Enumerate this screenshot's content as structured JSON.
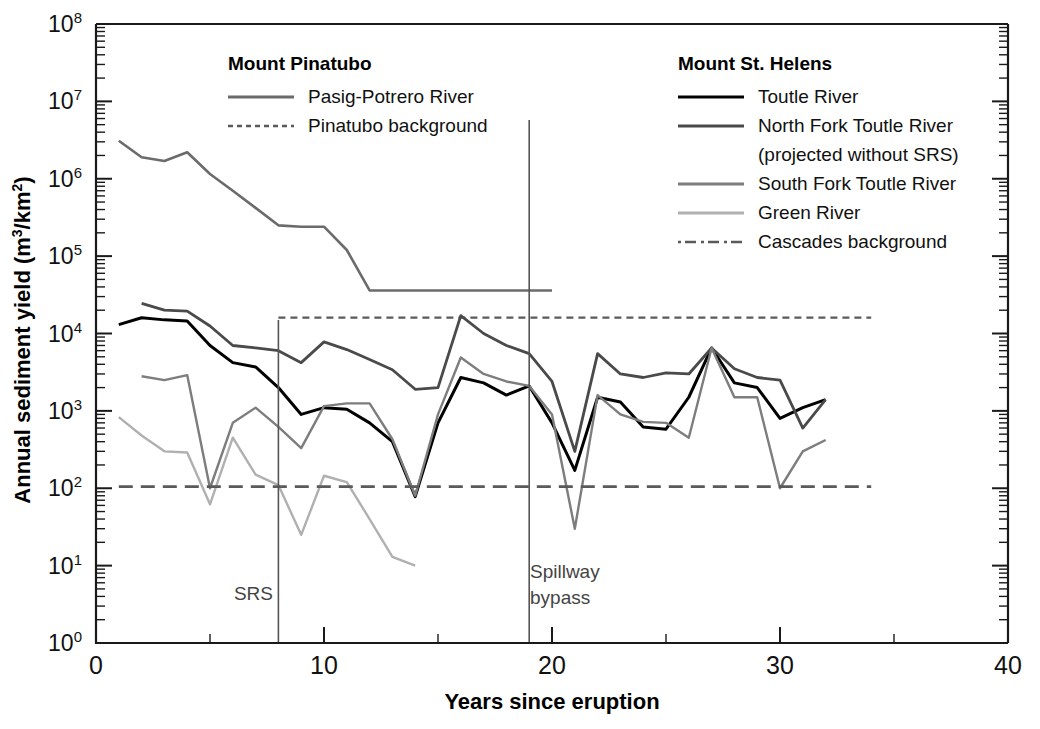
{
  "chart_data": {
    "type": "line",
    "title": "",
    "xlabel": "Years since eruption",
    "ylabel": "Annual sediment yield (m3/km2)",
    "ylabel_parts": {
      "text": "Annual sediment yield (m",
      "sup1": "3",
      "mid": "/km",
      "sup2": "2",
      "tail": ")"
    },
    "xlim": [
      0,
      40
    ],
    "ylim": [
      1,
      100000000
    ],
    "yscale": "log",
    "xscale": "linear",
    "grid": false,
    "xticks": [
      0,
      10,
      20,
      30,
      40
    ],
    "xticklabels": [
      "0",
      "10",
      "20",
      "30",
      "40"
    ],
    "xminorticks": [
      5,
      15,
      25,
      35
    ],
    "yticks": [
      1,
      10,
      100,
      1000,
      10000,
      100000,
      1000000,
      10000000,
      100000000
    ],
    "yticklabels": [
      "10⁰",
      "10¹",
      "10²",
      "10³",
      "10⁴",
      "10⁵",
      "10⁶",
      "10⁷",
      "10⁸"
    ],
    "yticklabel_exponents": [
      "0",
      "1",
      "2",
      "3",
      "4",
      "5",
      "6",
      "7",
      "8"
    ],
    "legend_position": "top-center",
    "series": [
      {
        "name": "Pasig-Potrero River",
        "group": "Mount Pinatubo",
        "color": "#6b6b6b",
        "width": 2.6,
        "dash": "none",
        "x": [
          1,
          2,
          3,
          4,
          5,
          6,
          7,
          8,
          9,
          10,
          11,
          12,
          13,
          14,
          15,
          16,
          17,
          18,
          19,
          20
        ],
        "y": [
          3100000,
          1900000,
          1700000,
          2200000,
          1150000,
          700000,
          420000,
          250000,
          240000,
          240000,
          120000,
          36000,
          36000,
          36000,
          36000,
          36000,
          36000,
          36000,
          36000,
          36000
        ]
      },
      {
        "name": "Pinatubo background",
        "group": "Mount Pinatubo",
        "color": "#5a5a5a",
        "width": 2.2,
        "dash": "7,5",
        "x": [
          8,
          34
        ],
        "y": [
          16000,
          16000
        ],
        "constant": 16000
      },
      {
        "name": "Toutle River",
        "group": "Mount St. Helens",
        "color": "#000000",
        "width": 3.0,
        "dash": "none",
        "x": [
          1,
          2,
          3,
          4,
          5,
          6,
          7,
          8,
          9,
          10,
          11,
          12,
          13,
          14,
          15,
          16,
          17,
          18,
          19,
          20,
          21,
          22,
          23,
          24,
          25,
          26,
          27,
          28,
          29,
          30,
          31,
          32
        ],
        "y": [
          13000,
          16000,
          15000,
          14500,
          7000,
          4200,
          3700,
          2000,
          900,
          1100,
          1050,
          700,
          400,
          78,
          700,
          2700,
          2300,
          1600,
          2100,
          700,
          170,
          1500,
          1300,
          620,
          580,
          1500,
          6500,
          2300,
          2000,
          800,
          1100,
          1400
        ]
      },
      {
        "name": "North Fork Toutle River (projected without SRS)",
        "group": "Mount St. Helens",
        "color": "#4a4a4a",
        "width": 2.8,
        "dash": "none",
        "x": [
          2,
          3,
          4,
          5,
          6,
          7,
          8,
          9,
          10,
          11,
          12,
          13,
          14,
          15,
          16,
          17,
          18,
          19,
          20,
          21,
          22,
          23,
          24,
          25,
          26,
          27,
          28,
          29,
          30,
          31,
          32
        ],
        "y": [
          24500,
          20000,
          19500,
          12500,
          7000,
          6500,
          6000,
          4200,
          7800,
          6200,
          4600,
          3400,
          1900,
          2000,
          17000,
          10000,
          7000,
          5500,
          2400,
          300,
          5500,
          3000,
          2700,
          3100,
          3000,
          6500,
          3500,
          2700,
          2500,
          600,
          1400
        ]
      },
      {
        "name": "South Fork Toutle River",
        "group": "Mount St. Helens",
        "color": "#7d7d7d",
        "width": 2.4,
        "dash": "none",
        "x": [
          2,
          3,
          4,
          5,
          6,
          7,
          8,
          9,
          10,
          11,
          12,
          13,
          14,
          15,
          16,
          17,
          18,
          19,
          20,
          21,
          22,
          23,
          24,
          25,
          26,
          27,
          28,
          29,
          30,
          31,
          32
        ],
        "y": [
          2800,
          2500,
          2900,
          100,
          700,
          1100,
          620,
          330,
          1150,
          1250,
          1250,
          430,
          80,
          900,
          4900,
          3000,
          2400,
          2100,
          900,
          30,
          1600,
          900,
          720,
          700,
          450,
          6500,
          1500,
          1500,
          100,
          300,
          420
        ]
      },
      {
        "name": "Green River",
        "group": "Mount St. Helens",
        "color": "#b0b0b0",
        "width": 2.4,
        "dash": "none",
        "x": [
          1,
          2,
          3,
          4,
          5,
          6,
          7,
          8,
          9,
          10,
          11,
          12,
          13,
          14
        ],
        "y": [
          830,
          480,
          300,
          290,
          62,
          450,
          150,
          110,
          25,
          145,
          120,
          40,
          13,
          10
        ]
      },
      {
        "name": "Cascades background",
        "group": "Mount St. Helens",
        "color": "#5a5a5a",
        "width": 2.6,
        "dash": "14,8",
        "x": [
          1,
          34
        ],
        "y": [
          105,
          105
        ],
        "constant": 105
      }
    ],
    "annotations": [
      {
        "label": "SRS",
        "x": 8,
        "type": "vertical-line",
        "text_anchor": "end",
        "text_x": 7.6,
        "text_y": 320
      },
      {
        "label_line1": "Spillway",
        "label_line2": "bypass",
        "x": 19,
        "type": "vertical-line",
        "text_anchor": "start",
        "text_x": 19.4,
        "text_y": 120
      }
    ]
  },
  "legend": {
    "columns": [
      {
        "heading": "Mount Pinatubo",
        "entries": [
          {
            "label": "Pasig-Potrero River",
            "color": "#6b6b6b",
            "dash": "none"
          },
          {
            "label": "Pinatubo background",
            "color": "#5a5a5a",
            "dash": "5,4"
          }
        ]
      },
      {
        "heading": "Mount St. Helens",
        "entries": [
          {
            "label": "Toutle River",
            "label2": "",
            "color": "#000000",
            "dash": "none"
          },
          {
            "label": "North Fork Toutle River",
            "label2": "(projected without SRS)",
            "color": "#4a4a4a",
            "dash": "none"
          },
          {
            "label": "South Fork Toutle River",
            "label2": "",
            "color": "#7d7d7d",
            "dash": "none"
          },
          {
            "label": "Green River",
            "label2": "",
            "color": "#b0b0b0",
            "dash": "none"
          },
          {
            "label": "Cascades background",
            "label2": "",
            "color": "#5a5a5a",
            "dash": "3,4,11,5"
          }
        ]
      }
    ]
  },
  "annotations": {
    "srs": "SRS",
    "spillway_line1": "Spillway",
    "spillway_line2": "bypass"
  },
  "axes": {
    "x_title": "Years since eruption",
    "y_title_main": "Annual sediment yield (m",
    "y_title_sup1": "3",
    "y_title_mid": "/km",
    "y_title_sup2": "2",
    "y_title_tail": ")"
  }
}
